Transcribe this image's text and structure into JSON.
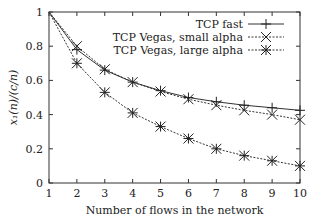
{
  "chart_data": {
    "type": "line",
    "title": "",
    "xlabel": "Number of flows in the network",
    "ylabel": "x₁(n)/(c/n)",
    "xlim": [
      1,
      10
    ],
    "ylim": [
      0,
      1
    ],
    "x": [
      1,
      2,
      3,
      4,
      5,
      6,
      7,
      8,
      9,
      10
    ],
    "xticks": [
      "1",
      "2",
      "3",
      "4",
      "5",
      "6",
      "7",
      "8",
      "9",
      "10"
    ],
    "yticks": [
      "0",
      "0.2",
      "0.4",
      "0.6",
      "0.8",
      "1"
    ],
    "yticks_values": [
      0,
      0.2,
      0.4,
      0.6,
      0.8,
      1
    ],
    "grid": false,
    "legend_position": "top-right",
    "series": [
      {
        "name": "TCP fast",
        "marker": "plus",
        "line": "solid",
        "values": [
          1.0,
          0.78,
          0.66,
          0.59,
          0.54,
          0.5,
          0.475,
          0.455,
          0.44,
          0.425
        ]
      },
      {
        "name": "TCP Vegas, small alpha",
        "marker": "cross",
        "line": "dotted",
        "values": [
          1.0,
          0.8,
          0.665,
          0.59,
          0.535,
          0.49,
          0.455,
          0.425,
          0.4,
          0.37
        ]
      },
      {
        "name": "TCP Vegas, large alpha",
        "marker": "star",
        "line": "dotted",
        "values": [
          1.0,
          0.7,
          0.53,
          0.41,
          0.33,
          0.26,
          0.2,
          0.16,
          0.13,
          0.1
        ]
      }
    ]
  }
}
